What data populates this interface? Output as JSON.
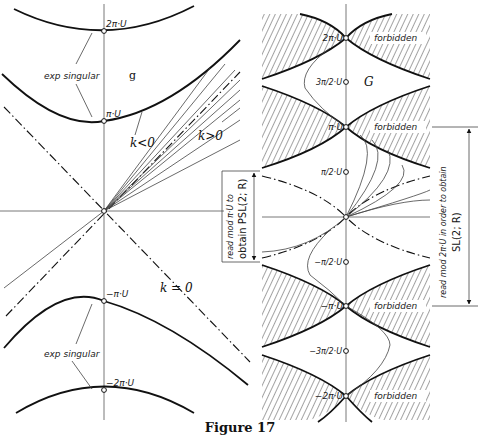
{
  "caption": "Figure 17",
  "left_panel": {
    "algebra_label": "g",
    "labels": {
      "two_pi": "2π·U",
      "pi": "π·U",
      "neg_pi": "−π·U",
      "neg_two_pi": "−2π·U"
    },
    "exp_singular_top": "exp singular",
    "exp_singular_bottom": "exp singular",
    "k_neg": "k<0",
    "k_pos": "k>0",
    "k_zero": "k = 0",
    "side_note_line1": "read mod  π·U to",
    "side_note_line2": "obtain  PSL(2; R)"
  },
  "right_panel": {
    "group_label": "G",
    "labels": {
      "two_pi": "2π·U",
      "three_half_pi": "3π/2·U",
      "pi": "π·U",
      "half_pi": "π/2·U",
      "neg_half_pi": "−π/2·U",
      "neg_pi": "−π·U",
      "neg_three_half_pi": "−3π/2·U",
      "neg_two_pi": "−2π·U"
    },
    "forbidden": [
      "forbidden",
      "forbidden",
      "forbidden",
      "forbidden"
    ],
    "side_note_line1": "read mod  2π·U in order to obtain",
    "side_note_line2": "SL(2; R)"
  },
  "colors": {
    "ink": "#111111",
    "background": "#ffffff"
  }
}
